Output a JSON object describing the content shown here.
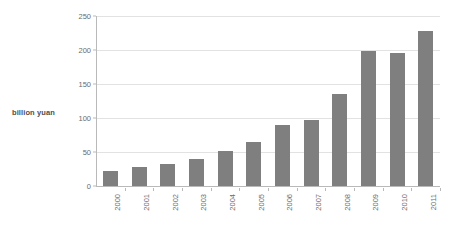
{
  "chart_data": {
    "type": "bar",
    "title": "",
    "subtitle": "",
    "xlabel": "",
    "ylabel": "billion yuan",
    "categories": [
      "2000",
      "2001",
      "2002",
      "2003",
      "2004",
      "2005",
      "2006",
      "2007",
      "2008",
      "2009",
      "2010",
      "2011"
    ],
    "values": [
      22,
      28,
      33,
      40,
      51,
      64,
      90,
      97,
      135,
      198,
      195,
      228
    ],
    "series": [
      {
        "name": "billion yuan",
        "values": [
          22,
          28,
          33,
          40,
          51,
          64,
          90,
          97,
          135,
          198,
          195,
          228
        ]
      }
    ],
    "ylim": [
      0,
      250
    ],
    "yticks": [
      0,
      50,
      100,
      150,
      200,
      250
    ],
    "ytick_labels": [
      "0",
      "50",
      "100",
      "150",
      "200",
      "250"
    ],
    "grid": true,
    "grid_axis": "y",
    "legend": false,
    "legend_position": "none",
    "bar_color": "#7f7f7f",
    "gridline_color": "#e2e2e2",
    "axis_color": "#b9b9b9",
    "text_color": "#6b6b6b",
    "background": "#ffffff",
    "xtick_label_rotation": -90,
    "annotations": []
  }
}
